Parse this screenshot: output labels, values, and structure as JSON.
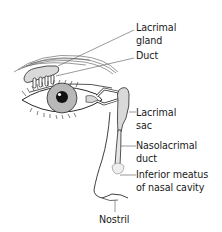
{
  "diagram": {
    "colors": {
      "line": "#2a2a2a",
      "iris": "#b8b8b8",
      "pupil": "#111111",
      "tissue_fill": "#d9d9d9",
      "leader": "#555555",
      "background": "#ffffff"
    },
    "labels": [
      {
        "id": "lacrimal-gland",
        "line1": "Lacrimal",
        "line2": "gland"
      },
      {
        "id": "duct",
        "line1": "Duct",
        "line2": ""
      },
      {
        "id": "lacrimal-sac",
        "line1": "Lacrimal",
        "line2": "sac"
      },
      {
        "id": "nasolacrimal-duct",
        "line1": "Nasolacrimal",
        "line2": "duct"
      },
      {
        "id": "inferior-meatus",
        "line1": "Inferior meatus",
        "line2": "of nasal cavity"
      },
      {
        "id": "nostril",
        "line1": "Nostril",
        "line2": ""
      }
    ]
  }
}
